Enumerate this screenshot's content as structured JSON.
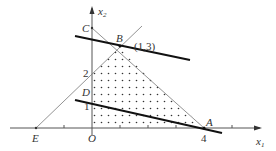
{
  "diagram": {
    "axes": {
      "x_label": "x",
      "x_sub": "1",
      "y_label": "x",
      "y_sub": "2",
      "origin_label": "O"
    },
    "points": {
      "A": {
        "label": "A",
        "coord": "(4,0)"
      },
      "B": {
        "label": "B",
        "coord": "(1,3)"
      },
      "C": {
        "label": "C"
      },
      "D": {
        "label": "D"
      },
      "E": {
        "label": "E"
      },
      "O": {
        "label": "O"
      }
    },
    "annotations": {
      "b_coord": "(1,3)",
      "x_tick_4": "4",
      "y_tick_1": "1",
      "y_tick_2": "2"
    },
    "colors": {
      "thin_line": "#666666",
      "thick_line": "#111111",
      "dots": "#333333",
      "text": "#333333"
    }
  }
}
